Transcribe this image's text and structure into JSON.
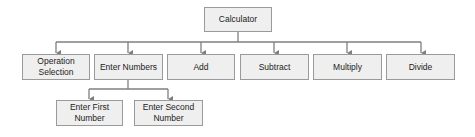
{
  "diagram": {
    "type": "hierarchy",
    "colors": {
      "box_fill": "#efefef",
      "box_border": "#9a9a9a",
      "connector": "#7f7f7f",
      "text": "#222222"
    },
    "root": {
      "id": "calculator",
      "label": "Calculator"
    },
    "level1": [
      {
        "id": "operation-selection",
        "label": "Operation Selection"
      },
      {
        "id": "enter-numbers",
        "label": "Enter Numbers"
      },
      {
        "id": "add",
        "label": "Add"
      },
      {
        "id": "subtract",
        "label": "Subtract"
      },
      {
        "id": "multiply",
        "label": "Multiply"
      },
      {
        "id": "divide",
        "label": "Divide"
      }
    ],
    "enter_numbers_children": [
      {
        "id": "enter-first-number",
        "label": "Enter First Number"
      },
      {
        "id": "enter-second-number",
        "label": "Enter Second Number"
      }
    ]
  }
}
